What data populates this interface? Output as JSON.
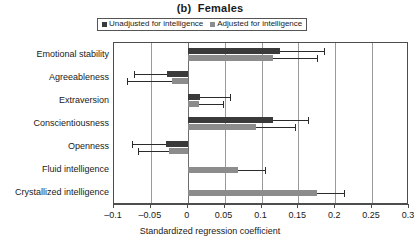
{
  "chart_data": {
    "type": "bar",
    "orientation": "horizontal",
    "title": "(b)  Females",
    "xlabel": "Standardized regression coefficient",
    "ylabel": "",
    "xlim": [
      -0.1,
      0.3
    ],
    "xticks": [
      "–0.1",
      "–0.05",
      "0",
      "0.05",
      "0.1",
      "0.15",
      "0.2",
      "0.25",
      "0.3"
    ],
    "xtick_values": [
      -0.1,
      -0.05,
      0,
      0.05,
      0.1,
      0.15,
      0.2,
      0.25,
      0.3
    ],
    "grid": true,
    "legend_position": "top",
    "categories": [
      "Emotional stability",
      "Agreeableness",
      "Extraversion",
      "Conscientiousness",
      "Openness",
      "Fluid intelligence",
      "Crystallized intelligence"
    ],
    "series": [
      {
        "name": "Unadjusted for intelligence",
        "color": "#3a3a3a",
        "values": [
          0.125,
          -0.028,
          0.017,
          0.115,
          -0.03,
          null,
          null
        ],
        "ci_low": [
          0.125,
          -0.073,
          0.017,
          0.115,
          -0.075,
          null,
          null
        ],
        "ci_high": [
          0.185,
          -0.028,
          0.057,
          0.163,
          -0.03,
          null,
          null
        ]
      },
      {
        "name": "Adjusted for intelligence",
        "color": "#8c8c8c",
        "values": [
          0.115,
          -0.022,
          0.015,
          0.093,
          -0.025,
          0.068,
          0.175
        ],
        "ci_low": [
          0.115,
          -0.082,
          0.015,
          0.093,
          -0.068,
          0.068,
          0.175
        ],
        "ci_high": [
          0.175,
          -0.022,
          0.048,
          0.145,
          -0.025,
          0.105,
          0.212
        ]
      }
    ]
  },
  "legend": {
    "items": [
      {
        "label": "Unadjusted for intelligence",
        "color": "#3a3a3a"
      },
      {
        "label": "Adjusted for intelligence",
        "color": "#8c8c8c"
      }
    ]
  }
}
